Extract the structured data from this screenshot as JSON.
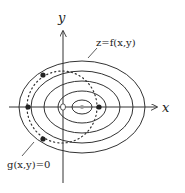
{
  "diagram": {
    "labels": {
      "y_axis": "y",
      "x_axis": "x",
      "level_curves": "z=f(x,y)",
      "constraint": "g(x,y)=0"
    },
    "colors": {
      "stroke": "#333333",
      "center_point": "#999999",
      "background": "#ffffff"
    },
    "level_curves_count": 5,
    "marked_points_count": 4
  }
}
